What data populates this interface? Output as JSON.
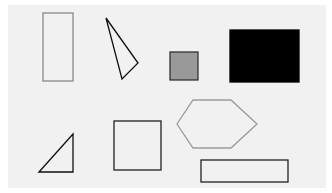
{
  "canvas": {
    "width": 332,
    "height": 193,
    "background": "#ffffff",
    "panel_color": "#f1f1f1"
  },
  "shapes": [
    {
      "id": "tall-rectangle",
      "type": "rect",
      "x": 43,
      "y": 13,
      "w": 30,
      "h": 68,
      "stroke": "#8a8a8a",
      "fill": "none"
    },
    {
      "id": "thin-triangle",
      "type": "polygon",
      "points": "106,18 138,63 122,79",
      "stroke": "#111111",
      "fill": "none"
    },
    {
      "id": "small-gray-square",
      "type": "rect",
      "x": 170,
      "y": 52,
      "w": 28,
      "h": 28,
      "stroke": "#333333",
      "fill": "#999999"
    },
    {
      "id": "black-rectangle",
      "type": "rect",
      "x": 230,
      "y": 30,
      "w": 69,
      "h": 52,
      "stroke": "#000000",
      "fill": "#000000"
    },
    {
      "id": "right-triangle",
      "type": "polygon",
      "points": "39,172 73,134 73,172",
      "stroke": "#111111",
      "fill": "none"
    },
    {
      "id": "outlined-square",
      "type": "rect",
      "x": 114,
      "y": 121,
      "w": 47,
      "h": 49,
      "stroke": "#222222",
      "fill": "none"
    },
    {
      "id": "hexagon",
      "type": "polygon",
      "points": "177,124 193,100 231,100 257,124 231,148 193,148",
      "stroke": "#9a9a9a",
      "fill": "none"
    },
    {
      "id": "wide-rectangle",
      "type": "rect",
      "x": 201,
      "y": 160,
      "w": 87,
      "h": 22,
      "stroke": "#222222",
      "fill": "none"
    }
  ]
}
